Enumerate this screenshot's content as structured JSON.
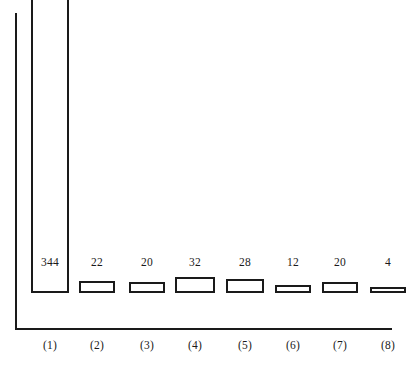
{
  "chart_data": {
    "type": "bar",
    "title": "",
    "subtitle": "",
    "xlabel": "",
    "ylabel": "",
    "grid": false,
    "legend": null,
    "axis_style": "two-axis-lines-no-ticks",
    "categories": [
      "(1)",
      "(2)",
      "(3)",
      "(4)",
      "(5)",
      "(6)",
      "(7)",
      "(8)"
    ],
    "values": [
      344,
      22,
      20,
      32,
      28,
      12,
      20,
      4
    ],
    "value_labels": [
      "344",
      "22",
      "20",
      "32",
      "28",
      "12",
      "20",
      "4"
    ],
    "value_label_position": "shared-row-above-baseline",
    "bar_style": {
      "fill": "#ffffff",
      "stroke": "#1a1a1a",
      "stroke_width_px": 2
    },
    "bars": [
      {
        "category": "(1)",
        "value": 344,
        "label": "344",
        "x": 31,
        "width": 38,
        "height": 307,
        "label_center_x": 50
      },
      {
        "category": "(2)",
        "value": 22,
        "label": "22",
        "x": 79,
        "width": 36,
        "height": 12,
        "label_center_x": 97
      },
      {
        "category": "(3)",
        "value": 20,
        "label": "20",
        "x": 129,
        "width": 36,
        "height": 11,
        "label_center_x": 147
      },
      {
        "category": "(4)",
        "value": 32,
        "label": "32",
        "x": 175,
        "width": 40,
        "height": 16,
        "label_center_x": 195
      },
      {
        "category": "(5)",
        "value": 28,
        "label": "28",
        "x": 226,
        "width": 38,
        "height": 14,
        "label_center_x": 245
      },
      {
        "category": "(6)",
        "value": 12,
        "label": "12",
        "x": 275,
        "width": 36,
        "height": 8,
        "label_center_x": 293
      },
      {
        "category": "(7)",
        "value": 20,
        "label": "20",
        "x": 322,
        "width": 36,
        "height": 11,
        "label_center_x": 340
      },
      {
        "category": "(8)",
        "value": 4,
        "label": "4",
        "x": 370,
        "width": 36,
        "height": 6,
        "label_center_x": 388
      }
    ]
  },
  "colors": {
    "ink": "#1a1a1a",
    "background": "#ffffff"
  }
}
